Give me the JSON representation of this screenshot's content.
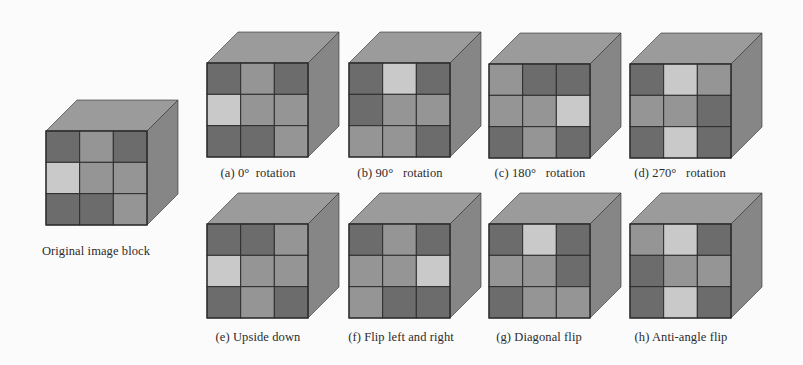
{
  "colors": {
    "D": "#6c6c6c",
    "M": "#959595",
    "L": "#c9c9c9",
    "top": "#9b9b9b",
    "side": "#868686",
    "grid_line": "#2e2e2e"
  },
  "legend": {
    "D": "dark cell",
    "M": "medium cell",
    "L": "light cell"
  },
  "cubes": [
    {
      "id": "original",
      "caption": "Original image block",
      "front_x": 46,
      "front_y": 131,
      "caption_x": 96,
      "caption_y": 244,
      "grid": [
        [
          "D",
          "M",
          "D"
        ],
        [
          "L",
          "M",
          "M"
        ],
        [
          "D",
          "D",
          "M"
        ]
      ]
    },
    {
      "id": "a",
      "caption": "(a) 0°  rotation",
      "front_x": 207,
      "front_y": 63,
      "caption_x": 258,
      "caption_y": 166,
      "grid": [
        [
          "D",
          "M",
          "D"
        ],
        [
          "L",
          "M",
          "M"
        ],
        [
          "D",
          "D",
          "M"
        ]
      ]
    },
    {
      "id": "b",
      "caption": "(b) 90°   rotation",
      "front_x": 349,
      "front_y": 63,
      "caption_x": 400,
      "caption_y": 166,
      "grid": [
        [
          "D",
          "L",
          "D"
        ],
        [
          "D",
          "M",
          "M"
        ],
        [
          "M",
          "M",
          "D"
        ]
      ]
    },
    {
      "id": "c",
      "caption": "(c) 180°   rotation",
      "front_x": 489,
      "front_y": 64,
      "caption_x": 540,
      "caption_y": 166,
      "grid": [
        [
          "M",
          "D",
          "D"
        ],
        [
          "M",
          "M",
          "L"
        ],
        [
          "D",
          "M",
          "D"
        ]
      ]
    },
    {
      "id": "d",
      "caption": "(d) 270°   rotation",
      "front_x": 630,
      "front_y": 64,
      "caption_x": 680,
      "caption_y": 166,
      "grid": [
        [
          "D",
          "L",
          "M"
        ],
        [
          "M",
          "M",
          "D"
        ],
        [
          "D",
          "L",
          "D"
        ]
      ]
    },
    {
      "id": "e",
      "caption": "(e) Upside down",
      "front_x": 207,
      "front_y": 224,
      "caption_x": 258,
      "caption_y": 330,
      "grid": [
        [
          "D",
          "D",
          "M"
        ],
        [
          "L",
          "M",
          "M"
        ],
        [
          "D",
          "M",
          "D"
        ]
      ]
    },
    {
      "id": "f",
      "caption": "(f) Flip left and right",
      "front_x": 349,
      "front_y": 224,
      "caption_x": 401,
      "caption_y": 330,
      "grid": [
        [
          "D",
          "M",
          "D"
        ],
        [
          "M",
          "M",
          "L"
        ],
        [
          "M",
          "D",
          "D"
        ]
      ]
    },
    {
      "id": "g",
      "caption": "(g) Diagonal flip",
      "front_x": 489,
      "front_y": 224,
      "caption_x": 539,
      "caption_y": 330,
      "grid": [
        [
          "D",
          "L",
          "D"
        ],
        [
          "M",
          "M",
          "D"
        ],
        [
          "D",
          "M",
          "M"
        ]
      ]
    },
    {
      "id": "h",
      "caption": "(h) Anti-angle flip",
      "front_x": 630,
      "front_y": 224,
      "caption_x": 681,
      "caption_y": 330,
      "grid": [
        [
          "M",
          "L",
          "D"
        ],
        [
          "D",
          "M",
          "M"
        ],
        [
          "D",
          "L",
          "D"
        ]
      ]
    }
  ],
  "geometry": {
    "face_w": 101,
    "face_h": 94,
    "depth_x": 31,
    "depth_y": 31
  }
}
